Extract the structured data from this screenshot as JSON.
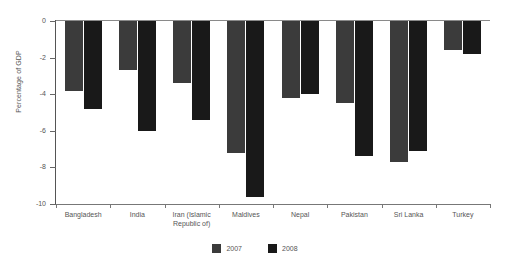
{
  "chart_data": {
    "type": "bar",
    "title": "",
    "subtitle": "",
    "xlabel": "",
    "ylabel": "Percentage of GDP",
    "ylim": [
      -10,
      0
    ],
    "yticks": [
      0,
      -2,
      -4,
      -6,
      -8,
      -10
    ],
    "ytick_labels": [
      "0",
      "-2",
      "-4",
      "-6",
      "-8",
      "-10"
    ],
    "grid": false,
    "legend_position": "bottom-center",
    "categories": [
      "Bangladesh",
      "India",
      "Iran (Islamic\nRepublic of)",
      "Maldives",
      "Nepal",
      "Pakistan",
      "Sri Lanka",
      "Turkey"
    ],
    "series": [
      {
        "name": "2007",
        "color": "#3b3b3b",
        "values": [
          -3.8,
          -2.7,
          -3.4,
          -7.2,
          -4.2,
          -4.5,
          -7.7,
          -1.6
        ]
      },
      {
        "name": "2008",
        "color": "#191919",
        "values": [
          -4.8,
          -6.0,
          -5.4,
          -9.6,
          -4.0,
          -7.4,
          -7.1,
          -1.8
        ]
      }
    ]
  },
  "axis": {
    "y_title": "Percentage of GDP"
  },
  "legend": {
    "items": [
      {
        "label": "2007",
        "color": "#3b3b3b"
      },
      {
        "label": "2008",
        "color": "#191919"
      }
    ]
  },
  "colors": {
    "series_2007": "#3b3b3b",
    "series_2008": "#191919",
    "axis": "#666666",
    "text": "#555555",
    "background": "#ffffff"
  }
}
